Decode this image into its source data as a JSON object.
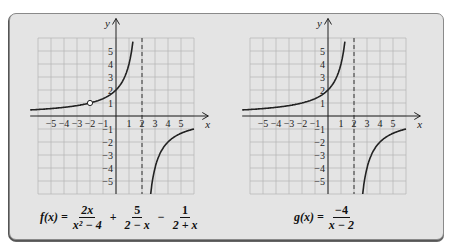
{
  "panel": {
    "background": "#e4e4e4"
  },
  "graphs": [
    {
      "id": "f",
      "axis_labels": {
        "x": "x",
        "y": "y"
      },
      "x_ticks": [
        "−5",
        "−4",
        "−3",
        "−2",
        "−1",
        "1",
        "2",
        "3",
        "4",
        "5"
      ],
      "y_ticks": [
        "5",
        "4",
        "3",
        "2",
        "1",
        "−1",
        "−2",
        "−3",
        "−4",
        "−5"
      ],
      "vertical_asymptote": 2,
      "hole": {
        "x": -2,
        "y": 1
      },
      "formula": {
        "lhs": "f(x) =",
        "terms": [
          {
            "num": "2x",
            "den": "x² − 4"
          },
          {
            "op": "+",
            "num": "5",
            "den": "2 − x"
          },
          {
            "op": "−",
            "num": "1",
            "den": "2 + x"
          }
        ]
      }
    },
    {
      "id": "g",
      "axis_labels": {
        "x": "x",
        "y": "y"
      },
      "x_ticks": [
        "−5",
        "−4",
        "−3",
        "−2",
        "−1",
        "1",
        "2",
        "3",
        "4",
        "5"
      ],
      "y_ticks": [
        "5",
        "4",
        "3",
        "2",
        "1",
        "−1",
        "−2",
        "−3",
        "−4",
        "−5"
      ],
      "vertical_asymptote": 2,
      "formula": {
        "lhs": "g(x) =",
        "terms": [
          {
            "num": "−4",
            "den": "x − 2"
          }
        ]
      }
    }
  ],
  "chart_data": [
    {
      "type": "line",
      "title": "f(x) = 2x/(x²−4) + 5/(2−x) − 1/(2+x)",
      "xlabel": "x",
      "ylabel": "y",
      "xlim": [
        -6,
        6
      ],
      "ylim": [
        -6,
        6
      ],
      "grid": true,
      "x_ticks": [
        -5,
        -4,
        -3,
        -2,
        -1,
        1,
        2,
        3,
        4,
        5
      ],
      "y_ticks": [
        -5,
        -4,
        -3,
        -2,
        -1,
        1,
        2,
        3,
        4,
        5
      ],
      "series": [
        {
          "name": "left branch",
          "x": [
            -6.5,
            -6,
            -5,
            -4,
            -3,
            -2,
            -1,
            0,
            0.5,
            1,
            1.2,
            1.33
          ],
          "y": [
            0.47,
            0.5,
            0.57,
            0.67,
            0.8,
            1,
            1.33,
            2,
            2.67,
            4,
            5,
            6
          ]
        },
        {
          "name": "right branch",
          "x": [
            2.67,
            3,
            3.5,
            4,
            5,
            6
          ],
          "y": [
            -6,
            -4,
            -2.67,
            -2,
            -1.33,
            -1
          ]
        }
      ],
      "annotations": [
        {
          "type": "open-circle",
          "x": -2,
          "y": 1
        },
        {
          "type": "dashed-vertical-asymptote",
          "x": 2
        }
      ]
    },
    {
      "type": "line",
      "title": "g(x) = −4/(x−2)",
      "xlabel": "x",
      "ylabel": "y",
      "xlim": [
        -6,
        6
      ],
      "ylim": [
        -6,
        6
      ],
      "grid": true,
      "x_ticks": [
        -5,
        -4,
        -3,
        -2,
        -1,
        1,
        2,
        3,
        4,
        5
      ],
      "y_ticks": [
        -5,
        -4,
        -3,
        -2,
        -1,
        1,
        2,
        3,
        4,
        5
      ],
      "series": [
        {
          "name": "left branch",
          "x": [
            -6.5,
            -6,
            -5,
            -4,
            -3,
            -2,
            -1,
            0,
            0.5,
            1,
            1.2,
            1.33
          ],
          "y": [
            0.47,
            0.5,
            0.57,
            0.67,
            0.8,
            1,
            1.33,
            2,
            2.67,
            4,
            5,
            6
          ]
        },
        {
          "name": "right branch",
          "x": [
            2.67,
            3,
            3.5,
            4,
            5,
            6
          ],
          "y": [
            -6,
            -4,
            -2.67,
            -2,
            -1.33,
            -1
          ]
        }
      ],
      "annotations": [
        {
          "type": "dashed-vertical-asymptote",
          "x": 2
        }
      ]
    }
  ]
}
